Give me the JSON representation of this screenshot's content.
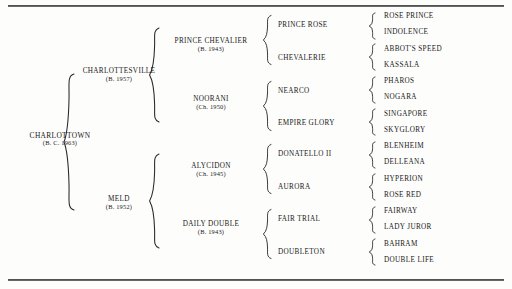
{
  "document": {
    "type": "pedigree-chart",
    "subject": "CHARLOTTOWN",
    "generations": 5
  },
  "rules": {
    "top_label": "top-horizontal-rule",
    "bottom_label": "bottom-horizontal-rule"
  },
  "gen1": {
    "name": "CHARLOTTOWN",
    "year": "(B. C. 1963)"
  },
  "gen2": [
    {
      "name": "CHARLOTTESVILLE",
      "year": "(B. 1957)"
    },
    {
      "name": "MELD",
      "year": "(B. 1952)"
    }
  ],
  "gen3": [
    {
      "name": "PRINCE CHEVALIER",
      "year": "(B. 1943)"
    },
    {
      "name": "NOORANI",
      "year": "(Ch. 1950)"
    },
    {
      "name": "ALYCIDON",
      "year": "(Ch. 1945)"
    },
    {
      "name": "DAILY DOUBLE",
      "year": "(B. 1943)"
    }
  ],
  "gen4": [
    {
      "name": "PRINCE ROSE"
    },
    {
      "name": "CHEVALERIE"
    },
    {
      "name": "NEARCO"
    },
    {
      "name": "EMPIRE GLORY"
    },
    {
      "name": "DONATELLO II"
    },
    {
      "name": "AURORA"
    },
    {
      "name": "FAIR TRIAL"
    },
    {
      "name": "DOUBLETON"
    }
  ],
  "gen5": [
    {
      "name": "ROSE PRINCE"
    },
    {
      "name": "INDOLENCE"
    },
    {
      "name": "ABBOT'S SPEED"
    },
    {
      "name": "KASSALA"
    },
    {
      "name": "PHAROS"
    },
    {
      "name": "NOGARA"
    },
    {
      "name": "SINGAPORE"
    },
    {
      "name": "SKYGLORY"
    },
    {
      "name": "BLENHEIM"
    },
    {
      "name": "DELLEANA"
    },
    {
      "name": "HYPERION"
    },
    {
      "name": "ROSE RED"
    },
    {
      "name": "FAIRWAY"
    },
    {
      "name": "LADY JUROR"
    },
    {
      "name": "BAHRAM"
    },
    {
      "name": "DOUBLE LIFE"
    }
  ]
}
